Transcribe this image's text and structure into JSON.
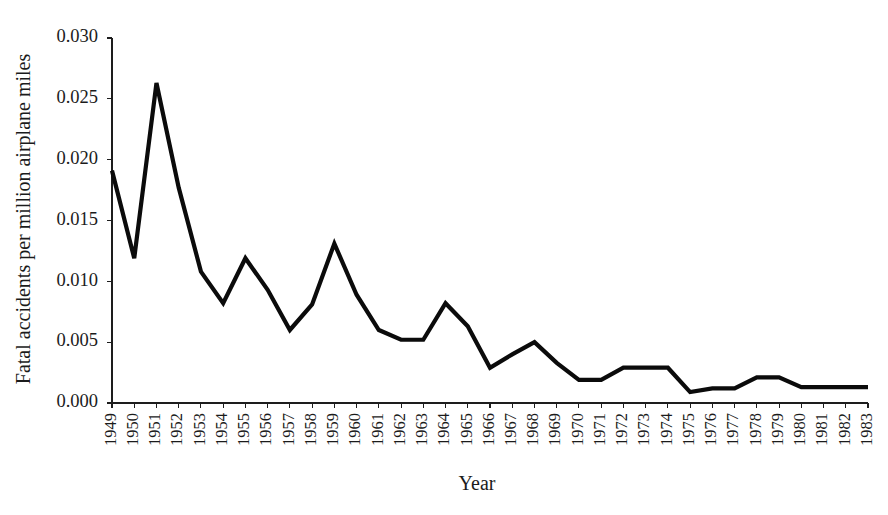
{
  "chart_data": {
    "type": "line",
    "title": "",
    "subtitle": "",
    "xlabel": "Year",
    "ylabel": "Fatal accidents per million airplane miles",
    "xlim": [
      1949,
      1983
    ],
    "ylim": [
      0.0,
      0.03
    ],
    "grid": false,
    "legend": null,
    "legend_position": "none",
    "series_color": "#0b0b0b",
    "y_ticks": [
      0.0,
      0.005,
      0.01,
      0.015,
      0.02,
      0.025,
      0.03
    ],
    "y_tick_labels": [
      "0.000",
      "0.005",
      "0.010",
      "0.015",
      "0.020",
      "0.025",
      "0.030"
    ],
    "categories": [
      "1949",
      "1950",
      "1951",
      "1952",
      "1953",
      "1954",
      "1955",
      "1956",
      "1957",
      "1958",
      "1959",
      "1960",
      "1961",
      "1962",
      "1963",
      "1964",
      "1965",
      "1966",
      "1967",
      "1968",
      "1969",
      "1970",
      "1971",
      "1972",
      "1973",
      "1974",
      "1975",
      "1976",
      "1977",
      "1978",
      "1979",
      "1980",
      "1981",
      "1982",
      "1983"
    ],
    "x": [
      1949,
      1950,
      1951,
      1952,
      1953,
      1954,
      1955,
      1956,
      1957,
      1958,
      1959,
      1960,
      1961,
      1962,
      1963,
      1964,
      1965,
      1966,
      1967,
      1968,
      1969,
      1970,
      1971,
      1972,
      1973,
      1974,
      1975,
      1976,
      1977,
      1978,
      1979,
      1980,
      1981,
      1982,
      1983
    ],
    "values": [
      0.0191,
      0.0119,
      0.0263,
      0.0177,
      0.0108,
      0.0082,
      0.0119,
      0.0093,
      0.006,
      0.0081,
      0.0131,
      0.0089,
      0.006,
      0.0052,
      0.0052,
      0.0082,
      0.0063,
      0.0029,
      0.004,
      0.005,
      0.0033,
      0.0019,
      0.0019,
      0.0029,
      0.0029,
      0.0029,
      0.0009,
      0.0012,
      0.0012,
      0.0021,
      0.0021,
      0.0013,
      0.0013,
      0.0013,
      0.0013
    ],
    "series": [
      {
        "name": "Fatal accidents per million airplane miles",
        "values": [
          0.0191,
          0.0119,
          0.0263,
          0.0177,
          0.0108,
          0.0082,
          0.0119,
          0.0093,
          0.006,
          0.0081,
          0.0131,
          0.0089,
          0.006,
          0.0052,
          0.0052,
          0.0082,
          0.0063,
          0.0029,
          0.004,
          0.005,
          0.0033,
          0.0019,
          0.0019,
          0.0029,
          0.0029,
          0.0029,
          0.0009,
          0.0012,
          0.0012,
          0.0021,
          0.0021,
          0.0013,
          0.0013,
          0.0013,
          0.0013
        ]
      }
    ],
    "annotations": []
  }
}
